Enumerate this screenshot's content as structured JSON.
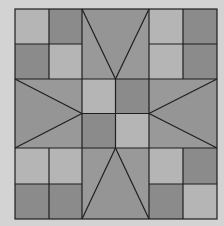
{
  "diagram": {
    "type": "quilt-block",
    "colors": {
      "background": "#d3d3d3",
      "light": "#b5b5b5",
      "dark": "#8b8b8b",
      "medium": "#999999",
      "line": "#1f1f1f"
    },
    "bounds": {
      "x0": 15,
      "y0": 9,
      "x1": 217,
      "y1": 219
    },
    "x_lines": [
      15,
      49,
      82,
      149,
      183,
      217
    ],
    "y_lines": [
      9,
      44,
      79,
      148,
      184,
      219
    ],
    "corner_four_patches": [
      {
        "name": "top-left",
        "cells": [
          [
            "light",
            "dark"
          ],
          [
            "dark",
            "light"
          ]
        ]
      },
      {
        "name": "top-right",
        "cells": [
          [
            "light",
            "dark"
          ],
          [
            "light",
            "dark"
          ]
        ]
      },
      {
        "name": "bottom-left",
        "cells": [
          [
            "light",
            "light"
          ],
          [
            "dark",
            "dark"
          ]
        ]
      },
      {
        "name": "bottom-right",
        "cells": [
          [
            "light",
            "dark"
          ],
          [
            "dark",
            "light"
          ]
        ]
      }
    ],
    "center_four_patch": {
      "cells": [
        [
          "light",
          "dark"
        ],
        [
          "dark",
          "light"
        ]
      ]
    },
    "arms": [
      "top",
      "bottom",
      "left",
      "right"
    ]
  }
}
